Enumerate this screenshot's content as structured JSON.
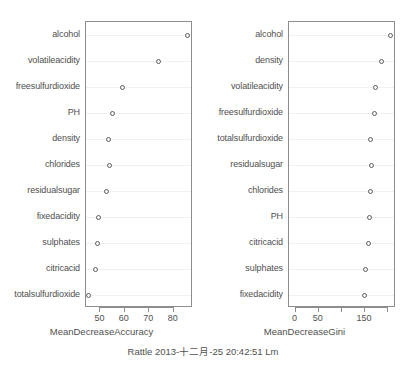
{
  "figure": {
    "caption": "Rattle 2013-十二月-25 20:42:51 Lm",
    "footnote": "",
    "point_color": "#5c5c5c",
    "frame_color": "#8d8d8d",
    "text_color": "#4f4f4f",
    "background": "#ffffff"
  },
  "chart_data": [
    {
      "type": "scatter",
      "panel": "left",
      "title": "",
      "xlabel": "MeanDecreaseAccuracy",
      "ylabel": "",
      "grid": true,
      "legend": "none",
      "xlim": [
        44.5,
        87.5
      ],
      "xticks": [
        50,
        60,
        70,
        80
      ],
      "xtick_labels": [
        "50",
        "60",
        "70",
        "80"
      ],
      "categories": [
        "alcohol",
        "volatileacidity",
        "freesulfurdioxide",
        "PH",
        "density",
        "chlorides",
        "residualsugar",
        "fixedacidity",
        "sulphates",
        "citricacid",
        "totalsulfurdioxide"
      ],
      "values": [
        85.5,
        73.8,
        59.2,
        55.0,
        53.2,
        53.6,
        52.6,
        49.4,
        48.7,
        47.8,
        45.3
      ]
    },
    {
      "type": "scatter",
      "panel": "right",
      "title": "",
      "xlabel": "MeanDecreaseGini",
      "ylabel": "",
      "grid": true,
      "legend": "none",
      "xlim": [
        -12,
        215
      ],
      "xticks": [
        0,
        50,
        100,
        150,
        200
      ],
      "xtick_labels": [
        "0",
        "50",
        "",
        "150",
        ""
      ],
      "categories": [
        "alcohol",
        "density",
        "volatileacidity",
        "freesulfurdioxide",
        "totalsulfurdioxide",
        "residualsugar",
        "chlorides",
        "PH",
        "citricacid",
        "sulphates",
        "fixedacidity"
      ],
      "values": [
        206,
        185,
        172,
        170,
        163,
        164,
        163,
        160,
        157,
        152,
        148
      ]
    }
  ]
}
